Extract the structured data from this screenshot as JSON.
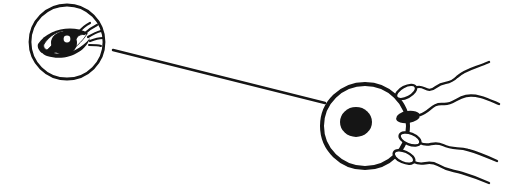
{
  "figure": {
    "title": "Eye observing fertilization of an ovum by sperm",
    "background_color": "#ffffff",
    "ink_color": "#151515",
    "width": 506,
    "height": 185
  },
  "observer": {
    "name": "eye-observer",
    "label": "eye",
    "shape": "circle",
    "center_x": 67,
    "center_y": 42,
    "radius": 37,
    "iris_fill": "#151515",
    "highlight_fill": "#ffffff",
    "eyelash_count": 5,
    "eyelash_direction": "upper-right"
  },
  "leader_line": {
    "name": "sight-line",
    "label": "line of sight",
    "x1": 113,
    "y1": 50,
    "x2": 325,
    "y2": 103,
    "stroke_width": 2.4
  },
  "ovum": {
    "name": "ovum",
    "label": "egg cell",
    "center_x": 365,
    "center_y": 126,
    "radius_x": 43,
    "radius_y": 42,
    "membrane_stroke_width": 4,
    "nucleus": {
      "label": "nucleus",
      "center_x": 356,
      "center_y": 122,
      "radius_x": 16,
      "radius_y": 15,
      "fill": "#151515"
    }
  },
  "sperm": [
    {
      "name": "sperm-upper",
      "label": "sperm",
      "head_state": "unfertilized",
      "head_fill": "#ffffff",
      "head_x": 406,
      "head_y": 92,
      "head_rx": 11,
      "head_ry": 5.5,
      "head_rotation": -28,
      "tail_path": "M 415 88 C 424 83, 426 95, 436 87 C 445 80, 448 86, 457 77 C 466 69, 476 68, 489 62"
    },
    {
      "name": "sperm-fertilizing",
      "label": "fertilizing sperm",
      "head_state": "fertilizing",
      "head_fill": "#151515",
      "head_x": 408,
      "head_y": 117,
      "head_rx": 12,
      "head_ry": 6,
      "head_rotation": -8,
      "tail_path": "M 420 115 C 430 112, 432 103, 443 104 C 453 105, 456 98, 466 96 C 477 94, 487 99, 499 104"
    },
    {
      "name": "sperm-lower-one",
      "label": "sperm",
      "head_state": "unfertilized",
      "head_fill": "#ffffff",
      "head_x": 410,
      "head_y": 139,
      "head_rx": 11,
      "head_ry": 5.5,
      "head_rotation": 22,
      "tail_path": "M 420 143 C 430 148, 432 140, 443 145 C 453 150, 458 147, 468 150 C 479 153, 488 157, 497 161"
    },
    {
      "name": "sperm-lower-two",
      "label": "sperm",
      "head_state": "unfertilized",
      "head_fill": "#ffffff",
      "head_x": 404,
      "head_y": 157,
      "head_rx": 11,
      "head_ry": 5.5,
      "head_rotation": 24,
      "tail_path": "M 414 162 C 424 167, 427 159, 438 165 C 448 171, 452 170, 462 173 C 472 176, 480 179, 489 183"
    }
  ],
  "artifacts": {
    "bleed_through_text": "",
    "note": "faint reverse-page scan bleed-through, illegible"
  }
}
